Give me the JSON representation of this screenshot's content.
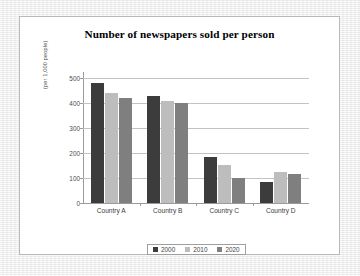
{
  "slide": {
    "background_color": "#efeff0",
    "panel_color": "#ffffff",
    "panel_border_color": "#b9b9bd"
  },
  "chart_data": {
    "type": "bar",
    "title": "Number of newspapers sold per person",
    "xlabel": "",
    "ylabel": "(per 1,000 people)",
    "categories": [
      "Country A",
      "Country B",
      "Country C",
      "Country D"
    ],
    "series": [
      {
        "name": "2000",
        "color": "#3c3c3c",
        "values": [
          480,
          430,
          185,
          85
        ]
      },
      {
        "name": "2010",
        "color": "#bdbdbd",
        "values": [
          440,
          410,
          152,
          125
        ]
      },
      {
        "name": "2020",
        "color": "#7f7f7f",
        "values": [
          420,
          400,
          102,
          115
        ]
      }
    ],
    "ylim": [
      0,
      500
    ],
    "ytick_step": 100,
    "ytick_labels": [
      "0",
      "100",
      "200",
      "300",
      "400",
      "500"
    ],
    "grid": true,
    "grid_axis": "y",
    "legend_position": "bottom",
    "legend_entries": [
      "2000",
      "2010",
      "2020"
    ]
  }
}
